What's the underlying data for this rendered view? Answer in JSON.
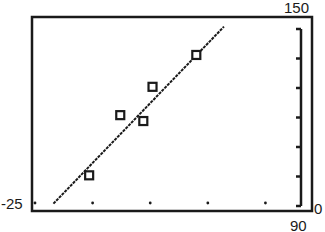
{
  "chart_data": {
    "type": "scatter",
    "title": "",
    "xlabel": "",
    "ylabel": "",
    "xlim": [
      -25,
      90
    ],
    "ylim": [
      0,
      150
    ],
    "x_tick_spacing": 25,
    "y_tick_spacing": 25,
    "grid": false,
    "legend": null,
    "window_labels": {
      "xmin": "-25",
      "xmax": "90",
      "ymin": "0",
      "ymax": "150"
    },
    "series": [
      {
        "name": "data points",
        "marker": "square",
        "points": [
          {
            "x": -1.5,
            "y": 26
          },
          {
            "x": 12,
            "y": 77
          },
          {
            "x": 22,
            "y": 72
          },
          {
            "x": 26,
            "y": 101
          },
          {
            "x": 45,
            "y": 128
          }
        ]
      },
      {
        "name": "regression line",
        "type": "line",
        "points": [
          {
            "x": -17,
            "y": 2
          },
          {
            "x": 57,
            "y": 152
          }
        ]
      }
    ]
  },
  "labels": {
    "xmin": "-25",
    "xmax": "90",
    "ymin": "0",
    "ymax": "150"
  }
}
